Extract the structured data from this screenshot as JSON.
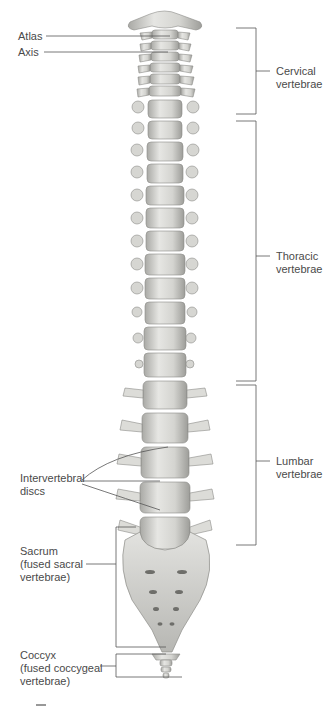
{
  "diagram": {
    "labels": {
      "atlas": "Atlas",
      "axis": "Axis",
      "cervical": "Cervical\nvertebrae",
      "thoracic": "Thoracic\nvertebrae",
      "lumbar": "Lumbar\nvertebrae",
      "discs": "Intervertebral\ndiscs",
      "sacrum": "Sacrum\n(fused sacral\nvertebrae)",
      "coccyx": "Coccyx\n(fused coccygeal\nvertebrae)"
    },
    "regions": [
      {
        "name": "Cervical vertebrae",
        "count": 7
      },
      {
        "name": "Thoracic vertebrae",
        "count": 12
      },
      {
        "name": "Lumbar vertebrae",
        "count": 5
      }
    ],
    "colors": {
      "bone": "#d9d9d6",
      "bone_shadow": "#9a9a96",
      "line": "#555555",
      "text": "#4a4a4a"
    }
  }
}
